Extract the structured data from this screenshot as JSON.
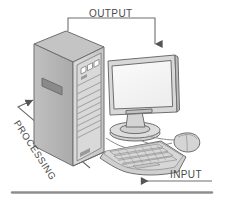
{
  "diagram": {
    "background_color": "#ffffff",
    "line_color": "#6e6e6e",
    "label_color": "#4a4a4a",
    "labels": {
      "output": "OUTPUT",
      "processing": "PROCESSING",
      "input": "INPUT"
    },
    "arrows": [
      {
        "name": "output-arrow",
        "label": "OUTPUT",
        "direction": "down",
        "points_to": "monitor"
      },
      {
        "name": "processing-arrow",
        "label": "PROCESSING",
        "direction": "up-right",
        "points_to": "tower"
      },
      {
        "name": "input-arrow",
        "label": "INPUT",
        "direction": "left",
        "points_to": "keyboard"
      }
    ],
    "components": [
      {
        "name": "tower",
        "label": "Computer tower"
      },
      {
        "name": "monitor",
        "label": "Monitor"
      },
      {
        "name": "keyboard",
        "label": "Keyboard"
      },
      {
        "name": "mouse",
        "label": "Mouse"
      },
      {
        "name": "ground-line",
        "label": "Desk surface line"
      }
    ],
    "palette": {
      "tower_side": "#b3b3b3",
      "tower_front": "#d2d2d2",
      "tower_top": "#c4c4c4",
      "screen": "#f5f5f5",
      "bezel": "#d8d8d8",
      "keyboard": "#c9c9c9",
      "mouse": "#d5d5d5",
      "outline": "#6e6e6e"
    }
  }
}
